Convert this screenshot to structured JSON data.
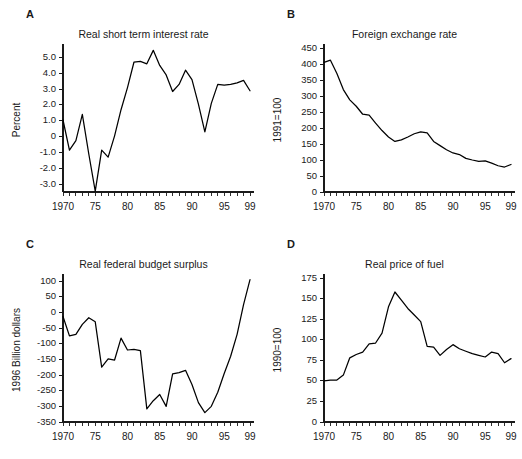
{
  "figure": {
    "panels": [
      {
        "letter": "A",
        "title": "Real short term interest rate",
        "ylabel": "Percent"
      },
      {
        "letter": "B",
        "title": "Foreign exchange rate",
        "ylabel": "1991=100"
      },
      {
        "letter": "C",
        "title": "Real federal budget surplus",
        "ylabel": "1996 Billion dollars"
      },
      {
        "letter": "D",
        "title": "Real price of fuel",
        "ylabel": "1990=100"
      }
    ]
  },
  "chart_data": [
    {
      "type": "line",
      "panel": "A",
      "title": "Real short term interest rate",
      "xlabel": "",
      "ylabel": "Percent",
      "xlim": [
        1970,
        1999
      ],
      "ylim": [
        -3.5,
        5.6
      ],
      "yticks": [
        5.0,
        4.0,
        3.0,
        2.0,
        1.0,
        0,
        -1.0,
        -2.0,
        -3.0
      ],
      "ytick_labels": [
        "5.0",
        "4.0",
        "3.0",
        "2.0",
        "1.0",
        "0",
        "-1.0",
        "-2.0",
        "-3.0"
      ],
      "xticks": [
        1970,
        1975,
        1980,
        1985,
        1990,
        1995,
        1999
      ],
      "xtick_labels": [
        "1970",
        "75",
        "80",
        "85",
        "90",
        "95",
        "99"
      ],
      "xtick_minor_step": 1,
      "grid": false,
      "legend": "none",
      "x": [
        1970,
        1971,
        1972,
        1973,
        1974,
        1975,
        1976,
        1977,
        1978,
        1979,
        1980,
        1981,
        1982,
        1983,
        1984,
        1985,
        1986,
        1987,
        1988,
        1989,
        1990,
        1991,
        1992,
        1993,
        1994,
        1995,
        1996,
        1997,
        1998,
        1999
      ],
      "values": [
        1.05,
        -0.85,
        -0.25,
        1.4,
        -1.1,
        -3.45,
        -0.85,
        -1.3,
        0.05,
        1.7,
        3.1,
        4.7,
        4.75,
        4.6,
        5.45,
        4.5,
        3.9,
        2.85,
        3.3,
        4.2,
        3.6,
        2.05,
        0.3,
        2.1,
        3.3,
        3.25,
        3.3,
        3.4,
        3.55,
        2.9
      ]
    },
    {
      "type": "line",
      "panel": "B",
      "title": "Foreign exchange rate",
      "xlabel": "",
      "ylabel": "1991=100",
      "xlim": [
        1970,
        1999
      ],
      "ylim": [
        0,
        450
      ],
      "yticks": [
        450,
        400,
        350,
        300,
        250,
        200,
        150,
        100,
        50,
        0
      ],
      "ytick_labels": [
        "450",
        "400",
        "350",
        "300",
        "250",
        "200",
        "150",
        "100",
        "50",
        "0"
      ],
      "xticks": [
        1970,
        1975,
        1980,
        1985,
        1990,
        1995,
        1999
      ],
      "xtick_labels": [
        "1970",
        "75",
        "80",
        "85",
        "90",
        "95",
        "99"
      ],
      "xtick_minor_step": 1,
      "grid": false,
      "legend": "none",
      "x": [
        1970,
        1971,
        1972,
        1973,
        1974,
        1975,
        1976,
        1977,
        1978,
        1979,
        1980,
        1981,
        1982,
        1983,
        1984,
        1985,
        1986,
        1987,
        1988,
        1989,
        1990,
        1991,
        1992,
        1993,
        1994,
        1995,
        1996,
        1997,
        1998,
        1999
      ],
      "values": [
        405,
        412,
        370,
        320,
        288,
        268,
        243,
        240,
        215,
        192,
        172,
        158,
        163,
        172,
        182,
        188,
        185,
        158,
        145,
        132,
        122,
        117,
        105,
        100,
        96,
        97,
        90,
        82,
        78,
        86
      ]
    },
    {
      "type": "line",
      "panel": "C",
      "title": "Real federal budget surplus",
      "xlabel": "",
      "ylabel": "1996 Billion dollars",
      "xlim": [
        1970,
        1999
      ],
      "ylim": [
        -350,
        110
      ],
      "yticks": [
        100,
        50,
        0,
        -50,
        -100,
        -150,
        -200,
        -250,
        -300,
        -350
      ],
      "ytick_labels": [
        "100",
        "50",
        "0",
        "-50",
        "-100",
        "-150",
        "-200",
        "-250",
        "-300",
        "-350"
      ],
      "xticks": [
        1970,
        1975,
        1980,
        1985,
        1990,
        1995,
        1999
      ],
      "xtick_labels": [
        "1970",
        "75",
        "80",
        "85",
        "90",
        "95",
        "99"
      ],
      "xtick_minor_step": 1,
      "grid": false,
      "legend": "none",
      "x": [
        1970,
        1971,
        1972,
        1973,
        1974,
        1975,
        1976,
        1977,
        1978,
        1979,
        1980,
        1981,
        1982,
        1983,
        1984,
        1985,
        1986,
        1987,
        1988,
        1989,
        1990,
        1991,
        1992,
        1993,
        1994,
        1995,
        1996,
        1997,
        1998,
        1999
      ],
      "values": [
        -13,
        -75,
        -70,
        -38,
        -17,
        -30,
        -175,
        -148,
        -152,
        -82,
        -120,
        -118,
        -122,
        -308,
        -282,
        -262,
        -300,
        -196,
        -192,
        -185,
        -230,
        -288,
        -320,
        -300,
        -255,
        -195,
        -140,
        -70,
        25,
        105
      ]
    },
    {
      "type": "line",
      "panel": "D",
      "title": "Real price of fuel",
      "xlabel": "",
      "ylabel": "1990=100",
      "xlim": [
        1970,
        1999
      ],
      "ylim": [
        0,
        175
      ],
      "yticks": [
        175,
        150,
        125,
        100,
        75,
        50,
        25,
        0
      ],
      "ytick_labels": [
        "175",
        "150",
        "125",
        "100",
        "75",
        "50",
        "25",
        "0"
      ],
      "xticks": [
        1970,
        1975,
        1980,
        1985,
        1990,
        1995,
        1999
      ],
      "xtick_labels": [
        "1970",
        "75",
        "80",
        "85",
        "90",
        "95",
        "99"
      ],
      "xtick_minor_step": 1,
      "grid": false,
      "legend": "none",
      "x": [
        1970,
        1971,
        1972,
        1973,
        1974,
        1975,
        1976,
        1977,
        1978,
        1979,
        1980,
        1981,
        1982,
        1983,
        1984,
        1985,
        1986,
        1987,
        1988,
        1989,
        1990,
        1991,
        1992,
        1993,
        1994,
        1995,
        1996,
        1997,
        1998,
        1999
      ],
      "values": [
        50,
        51,
        51,
        57,
        78,
        82,
        85,
        95,
        96,
        108,
        140,
        158,
        148,
        138,
        130,
        122,
        92,
        91,
        81,
        88,
        94,
        89,
        86,
        83,
        81,
        79,
        85,
        83,
        72,
        77
      ]
    }
  ]
}
